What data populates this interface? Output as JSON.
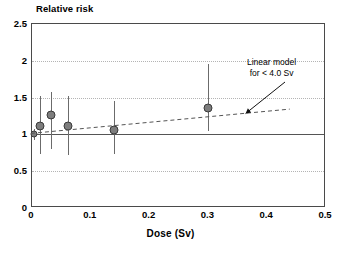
{
  "chart_data": {
    "type": "scatter",
    "title": "Relative risk",
    "xlabel": "Dose (Sv)",
    "ylabel": "Relative risk",
    "xlim": [
      0,
      0.5
    ],
    "ylim": [
      0,
      2.5
    ],
    "xticks": [
      "0",
      "0.1",
      "0.2",
      "0.3",
      "0.4",
      "0.5"
    ],
    "xtick_values": [
      0,
      0.1,
      0.2,
      0.3,
      0.4,
      0.5
    ],
    "yticks": [
      "0",
      "0.5",
      "1",
      "1.5",
      "2",
      "2.5"
    ],
    "ytick_values": [
      0,
      0.5,
      1,
      1.5,
      2,
      2.5
    ],
    "grid": "horizontal dotted gridlines at 0.5, 1.5, 2.0; solid reference line at 1.0",
    "reference_line": 1.0,
    "legend": "none",
    "points": [
      {
        "x": 0.003,
        "y": 1.0,
        "ci_low": 0.93,
        "ci_high": 1.07
      },
      {
        "x": 0.013,
        "y": 1.12,
        "ci_low": 0.73,
        "ci_high": 1.52
      },
      {
        "x": 0.033,
        "y": 1.27,
        "ci_low": 0.8,
        "ci_high": 1.58
      },
      {
        "x": 0.062,
        "y": 1.11,
        "ci_low": 0.72,
        "ci_high": 1.52
      },
      {
        "x": 0.14,
        "y": 1.06,
        "ci_low": 0.73,
        "ci_high": 1.45
      },
      {
        "x": 0.3,
        "y": 1.36,
        "ci_low": 1.05,
        "ci_high": 1.96
      }
    ],
    "series": [
      {
        "name": "Linear model for < 4.0 Sv",
        "type": "line",
        "style": "dashed",
        "x": [
          0.0,
          0.44
        ],
        "values": [
          1.0,
          1.33
        ]
      }
    ],
    "annotations": [
      {
        "name": "linear-model-annotation",
        "line1": "Linear model",
        "line2": "for < 4.0 Sv",
        "arrow": "points down-left to the dashed model line"
      }
    ]
  },
  "colors": {
    "marker_fill": "#7d7d7d",
    "marker_edge": "#3a3a3a",
    "errorbar": "#6b6b6b",
    "gridline": "#b4b4b4",
    "frame": "#4a4a4a",
    "reference": "#555555",
    "background": "#ffffff",
    "text": "#000000"
  }
}
